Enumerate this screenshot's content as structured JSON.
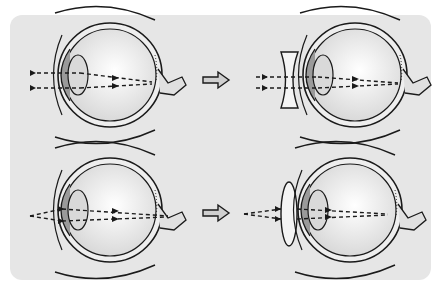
{
  "diagram": {
    "background_color": "#e6e6e6",
    "rows": [
      {
        "name": "myopia",
        "before": {
          "label": "eye-nearsighted",
          "rays": "converge-before-retina"
        },
        "arrow": "right-arrow",
        "after": {
          "lens": "concave-lens",
          "label": "eye-corrected-with-concave-lens",
          "rays": "converge-on-retina"
        }
      },
      {
        "name": "hyperopia",
        "before": {
          "label": "eye-farsighted",
          "rays": "converge-behind-retina"
        },
        "arrow": "right-arrow",
        "after": {
          "lens": "convex-lens",
          "label": "eye-corrected-with-convex-lens",
          "rays": "converge-on-retina"
        }
      }
    ],
    "colors": {
      "stroke": "#1a1a1a",
      "eyeball_fill": "#f4f4f4",
      "lens_fill": "#d9d9d9",
      "cornea_fill": "#9a9a9a",
      "arrow_fill": "#cfcfcf"
    }
  }
}
